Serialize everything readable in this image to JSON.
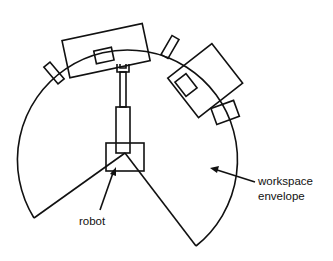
{
  "diagram": {
    "type": "robot workspace layout",
    "labels": {
      "robot": "robot",
      "workspace_line1": "workspace",
      "workspace_line2": "envelope"
    },
    "colors": {
      "stroke": "#111111",
      "background": "#ffffff"
    },
    "elements": [
      "workspace-envelope-arc",
      "robot-base",
      "robot-arm",
      "robot-gripper",
      "machine-top-large",
      "machine-right-large",
      "small-fixtures"
    ]
  }
}
